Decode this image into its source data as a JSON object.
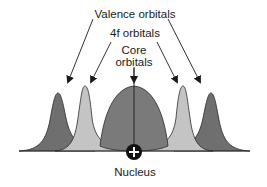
{
  "diagram": {
    "labels": {
      "valence": "Valence orbitals",
      "fourf": "4f orbitals",
      "core_line1": "Core",
      "core_line2": "orbitals",
      "nucleus": "Nucleus"
    },
    "nucleus_symbol": "+",
    "colors": {
      "valence_fill": "#6f6f6f",
      "fourf_fill": "#c4c4c4",
      "core_fill": "#7a7a7a",
      "outline": "#2a2a2a",
      "nucleus": "#111111",
      "arrow": "#1a1a1a"
    },
    "components": [
      {
        "name": "valence-orbital-left",
        "type": "valence"
      },
      {
        "name": "4f-orbital-left",
        "type": "4f"
      },
      {
        "name": "core-orbital",
        "type": "core"
      },
      {
        "name": "4f-orbital-right",
        "type": "4f"
      },
      {
        "name": "valence-orbital-right",
        "type": "valence"
      }
    ]
  }
}
